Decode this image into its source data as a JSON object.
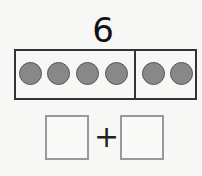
{
  "problem": {
    "number": "6",
    "frame": {
      "left_count": 4,
      "right_count": 2,
      "dot_color": "#888888"
    },
    "equation": {
      "operator": "+",
      "left_box_value": "",
      "right_box_value": ""
    }
  }
}
